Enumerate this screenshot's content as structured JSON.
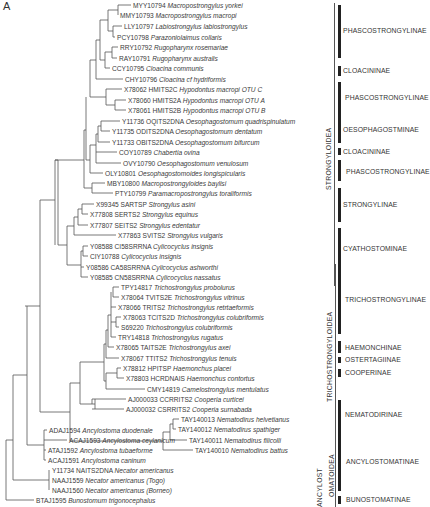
{
  "figure": {
    "panel_letter": "A",
    "leaves": [
      {
        "acc": "MYY10794",
        "species": "Macropostrongylus yorkei",
        "x": 133,
        "y": 5
      },
      {
        "acc": "MMY10793",
        "species": "Macropostrongylus macropi",
        "x": 120,
        "y": 15
      },
      {
        "acc": "LLY10797",
        "species": "Labiostrongylus labiostrongylus",
        "x": 124,
        "y": 26
      },
      {
        "acc": "PCY10798",
        "species": "Parazoniolaimus collaris",
        "x": 117,
        "y": 37
      },
      {
        "acc": "RRY10792",
        "species": "Rugopharynx rosemariae",
        "x": 120,
        "y": 47
      },
      {
        "acc": "RAY10791",
        "species": "Rugopharynx australis",
        "x": 119,
        "y": 58
      },
      {
        "acc": "CCY10795",
        "species": "Cloacina communis",
        "x": 112,
        "y": 68
      },
      {
        "acc": "CHY10796",
        "species": "Cloacina cf hydriformis",
        "x": 125,
        "y": 79
      },
      {
        "acc": "X78062 HMITS2C",
        "species": "Hypodontus macropi OTU C",
        "x": 124,
        "y": 89
      },
      {
        "acc": "X78060 HMITS2A",
        "species": "Hypodontus macropi OTU A",
        "x": 128,
        "y": 100
      },
      {
        "acc": "X78061 HMITS2B",
        "species": "Hypodontus macropi OTU B",
        "x": 128,
        "y": 110
      },
      {
        "acc": "Y11736 OQITS2DNA",
        "species": "Oesophagostomum quadrispinulatum",
        "x": 122,
        "y": 121
      },
      {
        "acc": "Y11735 ODITS2DNA",
        "species": "Oesophagostomum dentatum",
        "x": 112,
        "y": 131
      },
      {
        "acc": "Y11733 OBITS2DNA",
        "species": "Oesophagostomum bifurcum",
        "x": 112,
        "y": 142
      },
      {
        "acc": "COY10789",
        "species": "Chabertia ovina",
        "x": 119,
        "y": 152
      },
      {
        "acc": "OVY10790",
        "species": "Oesophagostomum venulosum",
        "x": 123,
        "y": 163
      },
      {
        "acc": "OLY10801",
        "species": "Oesophagostomoides longispicularis",
        "x": 105,
        "y": 173
      },
      {
        "acc": "MBY10800",
        "species": "Macropostrongyloides baylisi",
        "x": 107,
        "y": 183
      },
      {
        "acc": "PTY10799",
        "species": "Paramacropostrongylus toraliformis",
        "x": 115,
        "y": 193
      },
      {
        "acc": "X99345 SARTSP",
        "species": "Strongylus asini",
        "x": 96,
        "y": 204
      },
      {
        "acc": "X77808 SERTS2",
        "species": "Strongylus equinus",
        "x": 90,
        "y": 214
      },
      {
        "acc": "X77807 SEITS2",
        "species": "Strongylus edentatur",
        "x": 90,
        "y": 225
      },
      {
        "acc": "X77863 SVITS2",
        "species": "Strongylus vulgaris",
        "x": 118,
        "y": 235
      },
      {
        "acc": "Y08588 CI58SRRNA",
        "species": "Cylicocyclus insignis",
        "x": 90,
        "y": 246
      },
      {
        "acc": "CIY10788",
        "species": "Cylicocyclus insignis",
        "x": 90,
        "y": 256
      },
      {
        "acc": "Y08586 CA58SRRNA",
        "species": "Cylicocyclus ashworthi",
        "x": 86,
        "y": 267
      },
      {
        "acc": "Y08585 CN58SRRNA",
        "species": "Cylicocyclus nassatus",
        "x": 90,
        "y": 277
      },
      {
        "acc": "TPY14817",
        "species": "Trichostrongylus probolurus",
        "x": 121,
        "y": 287
      },
      {
        "acc": "X78064 TVITS2E",
        "species": "Trichostrongylus vitrinus",
        "x": 121,
        "y": 297
      },
      {
        "acc": "X78066 TRITS2",
        "species": "Trichostrongylus retrtaeformis",
        "x": 118,
        "y": 307
      },
      {
        "acc": "X78063 TCITS2D",
        "species": "Trichostrongylus colubriformis",
        "x": 123,
        "y": 317
      },
      {
        "acc": "S69220",
        "species": "Trichostrongylus colubriformis",
        "x": 121,
        "y": 327
      },
      {
        "acc": "TRY14818",
        "species": "Trichostrongylus rugatus",
        "x": 118,
        "y": 337
      },
      {
        "acc": "X78065 TAITS2E",
        "species": "Trichostrongylus axei",
        "x": 116,
        "y": 347
      },
      {
        "acc": "X78067 TTITS2",
        "species": "Trichostrongylus tenuis",
        "x": 121,
        "y": 358
      },
      {
        "acc": "X78812 HPITSP",
        "species": "Haemonchus placei",
        "x": 123,
        "y": 368
      },
      {
        "acc": "X78803 HCRDNAIS",
        "species": "Haemonchus contortus",
        "x": 126,
        "y": 378
      },
      {
        "acc": "CMY14819",
        "species": "Camelostrongylus mentulatus",
        "x": 147,
        "y": 389
      },
      {
        "acc": "AJ000033 CCRRITS2",
        "species": "Cooperia curticei",
        "x": 128,
        "y": 399
      },
      {
        "acc": "AJ000032 CSRRITS2",
        "species": "Cooperia surnabada",
        "x": 126,
        "y": 409
      },
      {
        "acc": "TAY140013",
        "species": "Nematodirus helvetianus",
        "x": 181,
        "y": 419
      },
      {
        "acc": "TAY140012",
        "species": "Nematodirus spathiger",
        "x": 178,
        "y": 429
      },
      {
        "acc": "TAY140011",
        "species": "Nematodirus filicolli",
        "x": 189,
        "y": 440
      },
      {
        "acc": "TAY140010",
        "species": "Nematodirus battus",
        "x": 195,
        "y": 450
      },
      {
        "acc": "ADAJ1594",
        "species": "Ancylostoma duodenale",
        "x": 49,
        "y": 430
      },
      {
        "acc": "ACAJ1593",
        "species": "Ancylostoma ceylanicum",
        "x": 69,
        "y": 440
      },
      {
        "acc": "ATAJ1592",
        "species": "Ancylostoma tubaeforme",
        "x": 48,
        "y": 450
      },
      {
        "acc": "ACAJ1591",
        "species": "Ancylostoma caninum",
        "x": 48,
        "y": 460
      },
      {
        "acc": "Y11734 NAITS2DNA",
        "species": "Necator americanus",
        "x": 52,
        "y": 470
      },
      {
        "acc": "NAAJ1559",
        "species": "Necator americanus (Togo)",
        "x": 52,
        "y": 480
      },
      {
        "acc": "NAAJ1560",
        "species": "Necator americanus (Borneo)",
        "x": 52,
        "y": 490
      },
      {
        "acc": "BTAJ1595",
        "species": "Bunostomum trigonocephalus",
        "x": 36,
        "y": 500
      }
    ],
    "subfamilies": [
      {
        "label": "PHASCOSTRONGYLINAE",
        "bar_top": 5,
        "bar_bottom": 58,
        "label_x": 343,
        "label_y": 27
      },
      {
        "label": "CLOACININAE",
        "bar_top": 66,
        "bar_bottom": 76,
        "label_x": 343,
        "label_y": 67
      },
      {
        "label": "PHASCOSTRONGYLINAE",
        "bar_top": 82,
        "bar_bottom": 113,
        "label_x": 345,
        "label_y": 94
      },
      {
        "label": "OESOPHAGOSTMINAE",
        "bar_top": 113,
        "bar_bottom": 143,
        "label_x": 343,
        "label_y": 126
      },
      {
        "label": "CLOACININAE",
        "bar_top": 148,
        "bar_bottom": 155,
        "label_x": 343,
        "label_y": 148
      },
      {
        "label": "PHASCOSTRONGYLINAE",
        "bar_top": 160,
        "bar_bottom": 181,
        "label_x": 346,
        "label_y": 168
      },
      {
        "label": "STRONGYLINAE",
        "bar_top": 188,
        "bar_bottom": 222,
        "label_x": 343,
        "label_y": 201
      },
      {
        "label": "CYATHOSTOMINAE",
        "bar_top": 228,
        "bar_bottom": 283,
        "label_x": 343,
        "label_y": 245
      },
      {
        "label": "TRICHOSTRONGYLINAE",
        "bar_top": 265,
        "bar_bottom": 334,
        "label_x": 345,
        "label_y": 296
      },
      {
        "label": "HAEMONCHINAE",
        "bar_top": 341,
        "bar_bottom": 353,
        "label_x": 345,
        "label_y": 344
      },
      {
        "label": "OSTERTAGIINAE",
        "bar_top": 357,
        "bar_bottom": 363,
        "label_x": 345,
        "label_y": 356
      },
      {
        "label": "COOPERINAE",
        "bar_top": 369,
        "bar_bottom": 377,
        "label_x": 345,
        "label_y": 369
      },
      {
        "label": "NEMATODIRINAE",
        "bar_top": 400,
        "bar_bottom": 440,
        "label_x": 345,
        "label_y": 411
      },
      {
        "label": "ANCYLOSTOMATINAE",
        "bar_top": 426,
        "bar_bottom": 491,
        "label_x": 346,
        "label_y": 458
      },
      {
        "label": "BUNOSTOMATINAE",
        "bar_top": 496,
        "bar_bottom": 504,
        "label_x": 346,
        "label_y": 496
      }
    ],
    "superfamilies": [
      {
        "label": "STRONGYLOIDEA",
        "line_x": 334,
        "line_top": 3,
        "line_bottom": 286,
        "label_x": 325,
        "label_y": 190
      },
      {
        "label": "TRICHOSTRONGYLOIDEA",
        "line_x": 335,
        "line_top": 264,
        "line_bottom": 445,
        "label_x": 326,
        "label_y": 402
      },
      {
        "label": "ANCYLOST",
        "line_x": 335,
        "line_top": 426,
        "line_bottom": 507,
        "label_x": 316,
        "label_y": 507
      },
      {
        "label": "OMATOIDEA",
        "line_x": 335,
        "line_top": 426,
        "line_bottom": 507,
        "label_x": 328,
        "label_y": 497
      }
    ]
  }
}
